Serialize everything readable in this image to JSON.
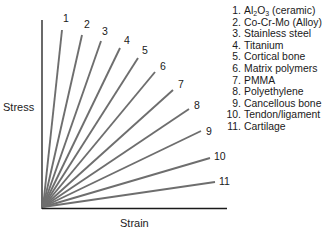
{
  "chart_data": {
    "type": "line",
    "title": "",
    "xlabel": "Strain",
    "ylabel": "Stress",
    "grid": false,
    "legend_position": "top-right",
    "origin": [
      0,
      0
    ],
    "series": [
      {
        "name": "Al2O3 (ceramic)",
        "label": "1",
        "slope_deg": 82
      },
      {
        "name": "Co-Cr-Mo (Alloy)",
        "label": "2",
        "slope_deg": 75
      },
      {
        "name": "Stainless steel",
        "label": "3",
        "slope_deg": 68
      },
      {
        "name": "Titanium",
        "label": "4",
        "slope_deg": 62
      },
      {
        "name": "Cortical bone",
        "label": "5",
        "slope_deg": 55
      },
      {
        "name": "Matrix polymers",
        "label": "6",
        "slope_deg": 48
      },
      {
        "name": "PMMA",
        "label": "7",
        "slope_deg": 41
      },
      {
        "name": "Polyethylene",
        "label": "8",
        "slope_deg": 33
      },
      {
        "name": "Cancellous bone",
        "label": "9",
        "slope_deg": 24
      },
      {
        "name": "Tendon/ligament",
        "label": "10",
        "slope_deg": 16
      },
      {
        "name": "Cartilage",
        "label": "11",
        "slope_deg": 9
      }
    ]
  },
  "axes": {
    "x_label": "Strain",
    "y_label": "Stress"
  },
  "lines": [
    {
      "label": "1",
      "x2": 62,
      "y2": 30,
      "lx": 63,
      "ly": 22
    },
    {
      "label": "2",
      "x2": 82,
      "y2": 35,
      "lx": 84,
      "ly": 28
    },
    {
      "label": "3",
      "x2": 101,
      "y2": 41,
      "lx": 102,
      "ly": 35
    },
    {
      "label": "4",
      "x2": 120,
      "y2": 48,
      "lx": 124,
      "ly": 44
    },
    {
      "label": "5",
      "x2": 138,
      "y2": 58,
      "lx": 142,
      "ly": 54
    },
    {
      "label": "6",
      "x2": 155,
      "y2": 72,
      "lx": 160,
      "ly": 70
    },
    {
      "label": "7",
      "x2": 173,
      "y2": 90,
      "lx": 178,
      "ly": 88
    },
    {
      "label": "8",
      "x2": 189,
      "y2": 109,
      "lx": 194,
      "ly": 109
    },
    {
      "label": "9",
      "x2": 201,
      "y2": 131,
      "lx": 206,
      "ly": 135
    },
    {
      "label": "10",
      "x2": 210,
      "y2": 158,
      "lx": 214,
      "ly": 160
    },
    {
      "label": "11",
      "x2": 215,
      "y2": 182,
      "lx": 219,
      "ly": 185
    }
  ],
  "legend": [
    {
      "num": "1.",
      "text_pre": "Al",
      "sub1": "2",
      "mid": "O",
      "sub2": "3",
      "text_post": " (ceramic)"
    },
    {
      "num": "2.",
      "text": "Co-Cr-Mo (Alloy)"
    },
    {
      "num": "3.",
      "text": "Stainless steel"
    },
    {
      "num": "4.",
      "text": "Titanium"
    },
    {
      "num": "5.",
      "text": "Cortical bone"
    },
    {
      "num": "6.",
      "text": "Matrix polymers"
    },
    {
      "num": "7.",
      "text": "PMMA"
    },
    {
      "num": "8.",
      "text": "Polyethylene"
    },
    {
      "num": "9.",
      "text": "Cancellous bone"
    },
    {
      "num": "10.",
      "text": "Tendon/ligament"
    },
    {
      "num": "11.",
      "text": "Cartilage"
    }
  ],
  "colors": {
    "axis": "#1a1a1a",
    "line": "#6e6e6e"
  }
}
